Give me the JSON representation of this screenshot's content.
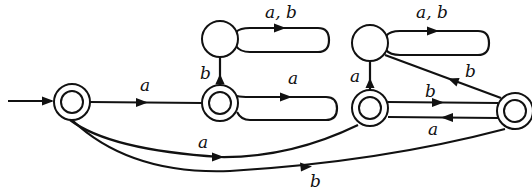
{
  "diagram": {
    "type": "finite-automaton",
    "states": [
      {
        "id": "q0",
        "cx": 72,
        "cy": 102,
        "accepting": true,
        "initial": true
      },
      {
        "id": "q1",
        "cx": 220,
        "cy": 103,
        "accepting": true
      },
      {
        "id": "d1",
        "cx": 220,
        "cy": 39,
        "accepting": false
      },
      {
        "id": "q2",
        "cx": 370,
        "cy": 108,
        "accepting": true
      },
      {
        "id": "d2",
        "cx": 370,
        "cy": 43,
        "accepting": false
      },
      {
        "id": "q3",
        "cx": 515,
        "cy": 111,
        "accepting": true
      }
    ],
    "transitions": [
      {
        "from": "q0",
        "to": "q1",
        "label": "a"
      },
      {
        "from": "q0",
        "to": "q2",
        "label": "a"
      },
      {
        "from": "q0",
        "to": "q3",
        "label": "b"
      },
      {
        "from": "q1",
        "to": "q1",
        "label": "a"
      },
      {
        "from": "q1",
        "to": "d1",
        "label": "b"
      },
      {
        "from": "d1",
        "to": "d1",
        "label": "a, b"
      },
      {
        "from": "q2",
        "to": "d2",
        "label": "a"
      },
      {
        "from": "q2",
        "to": "q3",
        "label": "b"
      },
      {
        "from": "q3",
        "to": "q2",
        "label": "a"
      },
      {
        "from": "q3",
        "to": "d2",
        "label": "b"
      },
      {
        "from": "d2",
        "to": "d2",
        "label": "a, b"
      }
    ],
    "labels": {
      "q0_q1": "a",
      "q0_q2": "a",
      "q0_q3": "b",
      "q1_loop": "a",
      "q1_d1": "b",
      "d1_loop": "a, b",
      "q2_d2": "a",
      "q2_q3": "b",
      "q3_q2": "a",
      "q3_d2": "b",
      "d2_loop": "a, b"
    }
  }
}
